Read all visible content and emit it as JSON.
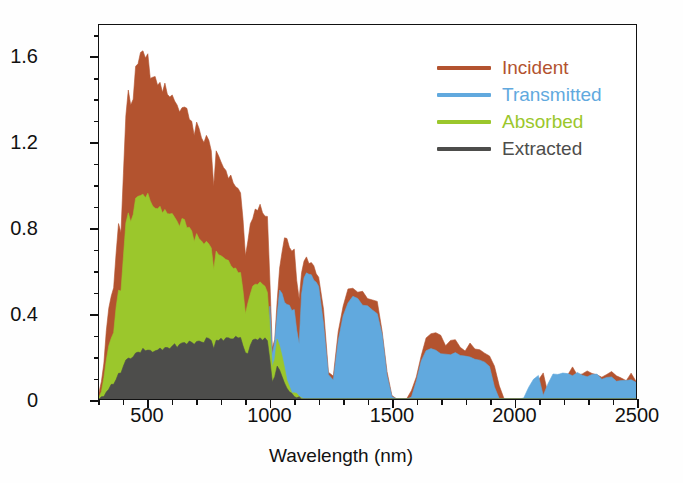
{
  "chart_data": {
    "type": "area",
    "title": "",
    "xlabel": "Wavelength (nm)",
    "ylabel": "Solar power (W m⁻² nm⁻¹)",
    "ylabel_parts": {
      "pre": "Solar power (W m",
      "sup1": "−2",
      "mid": " nm",
      "sup2": "−1",
      "post": ")"
    },
    "xlim": [
      300,
      2500
    ],
    "ylim": [
      0,
      1.75
    ],
    "grid": false,
    "stacked": true,
    "legend_position": "top-right",
    "xticks": [
      500,
      1000,
      1500,
      2000,
      2500
    ],
    "xtick_labels": [
      "500",
      "1000",
      "1500",
      "2000",
      "2500"
    ],
    "xminor_step": 100,
    "yticks": [
      0,
      0.4,
      0.8,
      1.2,
      1.6
    ],
    "ytick_labels": [
      "0",
      "0.4",
      "0.8",
      "1.2",
      "1.6"
    ],
    "yminor_step": 0.1,
    "series": [
      {
        "name": "Incident",
        "color": "#b3532f",
        "order": 4
      },
      {
        "name": "Transmitted",
        "color": "#61a9de",
        "order": 3
      },
      {
        "name": "Absorbed",
        "color": "#9bc72c",
        "order": 2
      },
      {
        "name": "Extracted",
        "color": "#4d4d4b",
        "order": 1
      }
    ],
    "x": [
      300,
      310,
      320,
      330,
      340,
      350,
      360,
      370,
      380,
      390,
      400,
      410,
      420,
      430,
      440,
      450,
      460,
      470,
      480,
      490,
      500,
      510,
      520,
      530,
      540,
      550,
      560,
      570,
      580,
      590,
      600,
      610,
      620,
      630,
      640,
      650,
      660,
      670,
      680,
      690,
      700,
      710,
      720,
      730,
      740,
      750,
      760,
      770,
      780,
      790,
      800,
      810,
      820,
      830,
      840,
      850,
      860,
      870,
      880,
      890,
      900,
      910,
      920,
      930,
      940,
      950,
      960,
      970,
      980,
      990,
      1000,
      1010,
      1020,
      1030,
      1040,
      1050,
      1060,
      1070,
      1080,
      1090,
      1100,
      1110,
      1120,
      1130,
      1140,
      1150,
      1160,
      1170,
      1180,
      1190,
      1200,
      1220,
      1240,
      1260,
      1280,
      1300,
      1320,
      1340,
      1360,
      1380,
      1400,
      1420,
      1440,
      1460,
      1480,
      1500,
      1520,
      1540,
      1560,
      1580,
      1600,
      1620,
      1640,
      1660,
      1680,
      1700,
      1720,
      1740,
      1760,
      1780,
      1800,
      1820,
      1840,
      1860,
      1880,
      1900,
      1920,
      1940,
      1960,
      1980,
      2000,
      2020,
      2040,
      2060,
      2080,
      2100,
      2120,
      2140,
      2160,
      2180,
      2200,
      2220,
      2240,
      2260,
      2280,
      2300,
      2320,
      2340,
      2360,
      2380,
      2400,
      2420,
      2440,
      2460,
      2480,
      2500
    ],
    "incident": [
      0.02,
      0.08,
      0.17,
      0.33,
      0.41,
      0.47,
      0.52,
      0.68,
      0.82,
      0.8,
      1.05,
      1.32,
      1.45,
      1.36,
      1.41,
      1.56,
      1.58,
      1.6,
      1.62,
      1.58,
      1.6,
      1.52,
      1.5,
      1.49,
      1.48,
      1.47,
      1.45,
      1.46,
      1.44,
      1.42,
      1.42,
      1.4,
      1.38,
      1.34,
      1.38,
      1.36,
      1.34,
      1.32,
      1.31,
      1.22,
      1.28,
      1.26,
      1.24,
      1.2,
      1.22,
      1.2,
      1.18,
      1.0,
      1.14,
      1.12,
      1.11,
      1.09,
      1.07,
      1.05,
      1.03,
      1.02,
      1.0,
      0.98,
      0.96,
      0.84,
      0.68,
      0.72,
      0.8,
      0.86,
      0.88,
      0.9,
      0.89,
      0.87,
      0.86,
      0.85,
      0.56,
      0.24,
      0.3,
      0.45,
      0.62,
      0.7,
      0.74,
      0.73,
      0.72,
      0.71,
      0.7,
      0.56,
      0.46,
      0.58,
      0.64,
      0.66,
      0.65,
      0.64,
      0.62,
      0.6,
      0.58,
      0.4,
      0.12,
      0.1,
      0.3,
      0.44,
      0.5,
      0.52,
      0.51,
      0.5,
      0.49,
      0.47,
      0.44,
      0.33,
      0.11,
      0.01,
      0.0,
      0.0,
      0.0,
      0.02,
      0.1,
      0.2,
      0.28,
      0.3,
      0.29,
      0.28,
      0.27,
      0.26,
      0.26,
      0.25,
      0.24,
      0.24,
      0.23,
      0.22,
      0.21,
      0.19,
      0.15,
      0.07,
      0.01,
      0.0,
      0.0,
      0.0,
      0.0,
      0.01,
      0.06,
      0.11,
      0.12,
      0.02,
      0.09,
      0.12,
      0.13,
      0.13,
      0.13,
      0.13,
      0.13,
      0.13,
      0.12,
      0.12,
      0.12,
      0.12,
      0.11,
      0.11,
      0.11,
      0.1,
      0.1,
      0.09,
      0.09,
      0.09,
      0.08,
      0.08,
      0.07,
      0.06,
      0.05,
      0.03,
      0.01
    ],
    "transmitted_fraction_note": "transmitted is ~0 below the 1120 nm band edge, then carries nearly the whole incident power",
    "absorbed_top": [
      0.01,
      0.04,
      0.09,
      0.18,
      0.24,
      0.28,
      0.32,
      0.42,
      0.52,
      0.51,
      0.66,
      0.82,
      0.88,
      0.84,
      0.87,
      0.94,
      0.95,
      0.96,
      0.97,
      0.95,
      0.96,
      0.92,
      0.91,
      0.9,
      0.9,
      0.89,
      0.88,
      0.88,
      0.87,
      0.86,
      0.86,
      0.85,
      0.84,
      0.81,
      0.84,
      0.83,
      0.81,
      0.8,
      0.79,
      0.74,
      0.77,
      0.76,
      0.75,
      0.73,
      0.74,
      0.73,
      0.71,
      0.61,
      0.69,
      0.68,
      0.67,
      0.66,
      0.65,
      0.64,
      0.62,
      0.62,
      0.61,
      0.59,
      0.58,
      0.51,
      0.41,
      0.44,
      0.48,
      0.52,
      0.53,
      0.54,
      0.54,
      0.53,
      0.52,
      0.51,
      0.34,
      0.15,
      0.18,
      0.27,
      0.25,
      0.2,
      0.14,
      0.09,
      0.06,
      0.04,
      0.03,
      0.02,
      0.01,
      0.01,
      0.0,
      0.0,
      0.0,
      0.0,
      0.0,
      0.0,
      0.0,
      0.0,
      0.0,
      0.0,
      0.0,
      0.0,
      0.0,
      0.0,
      0.0,
      0.0,
      0.0,
      0.0,
      0.0,
      0.0,
      0.0,
      0.0,
      0.0,
      0.0,
      0.0,
      0.0,
      0.0,
      0.0,
      0.0,
      0.0,
      0.0,
      0.0,
      0.0,
      0.0,
      0.0,
      0.0,
      0.0,
      0.0,
      0.0,
      0.0,
      0.0,
      0.0,
      0.0,
      0.0,
      0.0,
      0.0,
      0.0,
      0.0,
      0.0,
      0.0,
      0.0,
      0.0,
      0.0,
      0.0,
      0.0,
      0.0,
      0.0,
      0.0,
      0.0,
      0.0,
      0.0,
      0.0,
      0.0,
      0.0,
      0.0,
      0.0,
      0.0,
      0.0,
      0.0,
      0.0,
      0.0,
      0.0,
      0.0,
      0.0,
      0.0,
      0.0,
      0.0
    ],
    "transmitted_top": [
      0.0,
      0.0,
      0.0,
      0.0,
      0.0,
      0.0,
      0.0,
      0.0,
      0.0,
      0.0,
      0.0,
      0.0,
      0.0,
      0.0,
      0.0,
      0.0,
      0.0,
      0.0,
      0.0,
      0.0,
      0.0,
      0.0,
      0.0,
      0.0,
      0.0,
      0.0,
      0.0,
      0.0,
      0.0,
      0.0,
      0.0,
      0.0,
      0.0,
      0.0,
      0.0,
      0.0,
      0.0,
      0.0,
      0.0,
      0.0,
      0.0,
      0.0,
      0.0,
      0.0,
      0.0,
      0.0,
      0.0,
      0.0,
      0.0,
      0.0,
      0.0,
      0.0,
      0.0,
      0.0,
      0.0,
      0.0,
      0.0,
      0.0,
      0.0,
      0.0,
      0.0,
      0.0,
      0.0,
      0.0,
      0.0,
      0.0,
      0.0,
      0.0,
      0.0,
      0.0,
      0.43,
      0.2,
      0.26,
      0.4,
      0.5,
      0.49,
      0.46,
      0.44,
      0.43,
      0.42,
      0.41,
      0.33,
      0.27,
      0.48,
      0.56,
      0.59,
      0.58,
      0.57,
      0.56,
      0.54,
      0.52,
      0.36,
      0.11,
      0.09,
      0.27,
      0.4,
      0.45,
      0.47,
      0.46,
      0.45,
      0.44,
      0.42,
      0.39,
      0.29,
      0.1,
      0.01,
      0.0,
      0.0,
      0.0,
      0.02,
      0.09,
      0.17,
      0.23,
      0.24,
      0.23,
      0.22,
      0.22,
      0.21,
      0.21,
      0.2,
      0.2,
      0.19,
      0.19,
      0.18,
      0.17,
      0.15,
      0.06,
      0.01,
      0.0,
      0.0,
      0.0,
      0.0,
      0.01,
      0.05,
      0.1,
      0.11,
      0.02,
      0.08,
      0.11,
      0.12,
      0.12,
      0.12,
      0.12,
      0.12,
      0.11,
      0.11,
      0.11,
      0.11,
      0.1,
      0.1,
      0.1,
      0.09,
      0.09,
      0.08,
      0.08,
      0.08,
      0.07,
      0.07,
      0.06,
      0.05,
      0.04,
      0.02,
      0.0
    ],
    "extracted_top": [
      0.0,
      0.01,
      0.02,
      0.04,
      0.05,
      0.06,
      0.07,
      0.1,
      0.12,
      0.12,
      0.15,
      0.18,
      0.2,
      0.19,
      0.2,
      0.22,
      0.22,
      0.22,
      0.23,
      0.22,
      0.23,
      0.22,
      0.22,
      0.22,
      0.23,
      0.23,
      0.23,
      0.24,
      0.24,
      0.24,
      0.25,
      0.25,
      0.25,
      0.25,
      0.26,
      0.26,
      0.26,
      0.27,
      0.27,
      0.25,
      0.27,
      0.27,
      0.27,
      0.27,
      0.28,
      0.28,
      0.27,
      0.24,
      0.28,
      0.28,
      0.28,
      0.28,
      0.29,
      0.29,
      0.28,
      0.29,
      0.29,
      0.28,
      0.28,
      0.25,
      0.21,
      0.22,
      0.25,
      0.27,
      0.28,
      0.28,
      0.28,
      0.28,
      0.28,
      0.27,
      0.19,
      0.08,
      0.1,
      0.15,
      0.14,
      0.11,
      0.08,
      0.05,
      0.04,
      0.02,
      0.02,
      0.01,
      0.01,
      0.0,
      0.0,
      0.0,
      0.0,
      0.0,
      0.0,
      0.0,
      0.0,
      0.0,
      0.0,
      0.0,
      0.0,
      0.0,
      0.0,
      0.0,
      0.0,
      0.0,
      0.0,
      0.0,
      0.0,
      0.0,
      0.0,
      0.0,
      0.0,
      0.0,
      0.0,
      0.0,
      0.0,
      0.0,
      0.0,
      0.0,
      0.0,
      0.0,
      0.0,
      0.0,
      0.0,
      0.0,
      0.0,
      0.0,
      0.0,
      0.0,
      0.0,
      0.0,
      0.0,
      0.0,
      0.0,
      0.0,
      0.0,
      0.0,
      0.0,
      0.0,
      0.0,
      0.0,
      0.0,
      0.0,
      0.0,
      0.0,
      0.0,
      0.0,
      0.0,
      0.0,
      0.0,
      0.0,
      0.0,
      0.0,
      0.0,
      0.0,
      0.0,
      0.0,
      0.0,
      0.0,
      0.0,
      0.0,
      0.0,
      0.0,
      0.0,
      0.0,
      0.0
    ]
  },
  "legend": {
    "items": [
      {
        "label": "Incident",
        "color": "#b3532f"
      },
      {
        "label": "Transmitted",
        "color": "#61a9de"
      },
      {
        "label": "Absorbed",
        "color": "#9bc72c"
      },
      {
        "label": "Extracted",
        "color": "#4d4d4b"
      }
    ]
  }
}
